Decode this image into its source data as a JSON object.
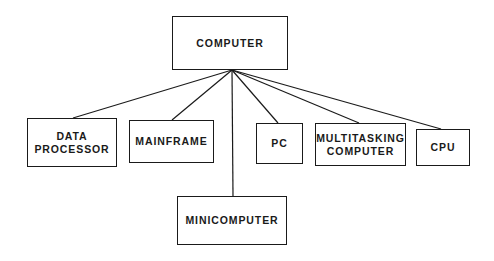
{
  "diagram": {
    "type": "hierarchy",
    "root": {
      "id": "computer",
      "label": "COMPUTER",
      "box": {
        "x": 172,
        "y": 16,
        "w": 116,
        "h": 54
      },
      "hub": {
        "x": 232,
        "y": 70
      }
    },
    "children": [
      {
        "id": "data-processor",
        "label": "DATA\nPROCESSOR",
        "box": {
          "x": 27,
          "y": 118,
          "w": 90,
          "h": 49
        },
        "anchor": {
          "x": 73,
          "y": 118
        }
      },
      {
        "id": "mainframe",
        "label": "MAINFRAME",
        "box": {
          "x": 129,
          "y": 120,
          "w": 85,
          "h": 43
        },
        "anchor": {
          "x": 172,
          "y": 120
        }
      },
      {
        "id": "minicomputer",
        "label": "MINICOMPUTER",
        "box": {
          "x": 177,
          "y": 196,
          "w": 110,
          "h": 49
        },
        "anchor": {
          "x": 233,
          "y": 196
        }
      },
      {
        "id": "pc",
        "label": "PC",
        "box": {
          "x": 256,
          "y": 123,
          "w": 47,
          "h": 41
        },
        "anchor": {
          "x": 278,
          "y": 123
        }
      },
      {
        "id": "multitasking-computer",
        "label": "MULTITASKING\nCOMPUTER",
        "box": {
          "x": 315,
          "y": 123,
          "w": 91,
          "h": 43
        },
        "anchor": {
          "x": 359,
          "y": 123
        }
      },
      {
        "id": "cpu",
        "label": "CPU",
        "box": {
          "x": 416,
          "y": 129,
          "w": 54,
          "h": 37
        },
        "anchor": {
          "x": 441,
          "y": 129
        }
      }
    ],
    "colors": {
      "line": "#1a1a1a",
      "background": "#ffffff",
      "text": "#1a1a1a"
    }
  }
}
